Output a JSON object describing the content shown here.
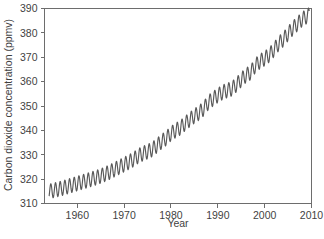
{
  "figure": {
    "background_color": "#ffffff",
    "line_color": "#595959",
    "axis_color": "#6d6d6d",
    "text_color": "#3f3f3f",
    "caption_partial": ""
  },
  "chart_data": {
    "type": "line",
    "title": "",
    "xlabel": "Year",
    "ylabel": "Carbon dioxide concentration (ppmv)",
    "xlim": [
      1953,
      2010
    ],
    "ylim": [
      310,
      390
    ],
    "xticks": [
      1960,
      1970,
      1980,
      1990,
      2000,
      2010
    ],
    "xtick_labels": [
      "1960",
      "1970",
      "1980",
      "1990",
      "2000",
      "2010"
    ],
    "yticks": [
      310,
      320,
      330,
      340,
      350,
      360,
      370,
      380,
      390
    ],
    "ytick_labels": [
      "310",
      "320",
      "330",
      "340",
      "350",
      "360",
      "370",
      "380",
      "390"
    ],
    "grid": false,
    "legend_position": "none",
    "annotations": [],
    "series": [
      {
        "name": "Mauna Loa atmospheric CO2 (monthly mean)",
        "description": "Keeling Curve: rising trend with annual seasonal sawtooth oscillation of roughly 6 ppmv peak-to-trough, peaking in May and troughing in September-October.",
        "seasonal_amplitude_ppmv": 3.0,
        "x": [
          1954,
          1955,
          1956,
          1957,
          1958,
          1959,
          1960,
          1961,
          1962,
          1963,
          1964,
          1965,
          1966,
          1967,
          1968,
          1969,
          1970,
          1971,
          1972,
          1973,
          1974,
          1975,
          1976,
          1977,
          1978,
          1979,
          1980,
          1981,
          1982,
          1983,
          1984,
          1985,
          1986,
          1987,
          1988,
          1989,
          1990,
          1991,
          1992,
          1993,
          1994,
          1995,
          1996,
          1997,
          1998,
          1999,
          2000,
          2001,
          2002,
          2003,
          2004,
          2005,
          2006,
          2007,
          2008,
          2009
        ],
        "annual_mean_values": [
          315.0,
          315.4,
          315.9,
          316.4,
          317.0,
          317.6,
          318.2,
          318.8,
          319.4,
          320.0,
          320.6,
          321.3,
          322.1,
          323.0,
          324.0,
          325.0,
          326.0,
          327.0,
          328.1,
          329.5,
          330.5,
          331.3,
          332.2,
          333.8,
          335.4,
          336.8,
          338.7,
          340.0,
          341.1,
          342.8,
          344.4,
          345.9,
          347.2,
          349.0,
          351.5,
          353.0,
          354.4,
          355.6,
          356.4,
          357.1,
          358.8,
          360.8,
          362.6,
          363.7,
          366.6,
          368.3,
          369.5,
          371.0,
          373.2,
          375.6,
          377.4,
          379.7,
          381.9,
          383.7,
          385.6,
          386.8
        ]
      }
    ]
  }
}
